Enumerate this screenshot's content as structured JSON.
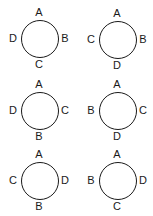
{
  "figures": [
    {
      "top": "A",
      "right": "B",
      "bottom": "C",
      "left": "D"
    },
    {
      "top": "A",
      "right": "B",
      "bottom": "D",
      "left": "C"
    },
    {
      "top": "A",
      "right": "C",
      "bottom": "B",
      "left": "D"
    },
    {
      "top": "A",
      "right": "C",
      "bottom": "D",
      "left": "B"
    },
    {
      "top": "A",
      "right": "D",
      "bottom": "B",
      "left": "C"
    },
    {
      "top": "A",
      "right": "D",
      "bottom": "C",
      "left": "B"
    }
  ],
  "colors": {
    "stroke": "#1a1a1a",
    "background": "#ffffff"
  }
}
